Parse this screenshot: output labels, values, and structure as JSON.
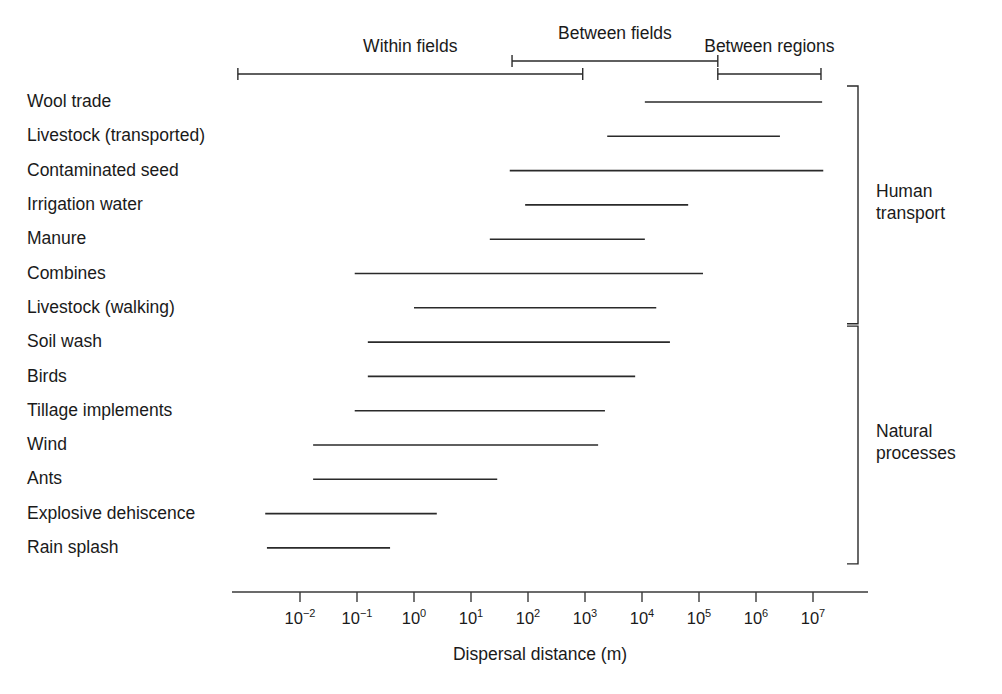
{
  "chart_data": {
    "type": "bar",
    "title": "",
    "xlabel": "Dispersal distance (m)",
    "ylabel": "",
    "scale": "log10",
    "xlim": [
      -2.9,
      7.3
    ],
    "grid": false,
    "tick_labels": [
      {
        "base": "10",
        "exp": "−2",
        "log": -2
      },
      {
        "base": "10",
        "exp": "−1",
        "log": -1
      },
      {
        "base": "10",
        "exp": "0",
        "log": 0
      },
      {
        "base": "10",
        "exp": "1",
        "log": 1
      },
      {
        "base": "10",
        "exp": "2",
        "log": 2
      },
      {
        "base": "10",
        "exp": "3",
        "log": 3
      },
      {
        "base": "10",
        "exp": "4",
        "log": 4
      },
      {
        "base": "10",
        "exp": "5",
        "log": 5
      },
      {
        "base": "10",
        "exp": "6",
        "log": 6
      },
      {
        "base": "10",
        "exp": "7",
        "log": 7
      }
    ],
    "categories": [
      "Wool trade",
      "Livestock (transported)",
      "Contaminated seed",
      "Irrigation water",
      "Manure",
      "Combines",
      "Livestock (walking)",
      "Soil wash",
      "Birds",
      "Tillage implements",
      "Wind",
      "Ants",
      "Explosive dehiscence",
      "Rain splash"
    ],
    "ranges_log10": [
      {
        "label": "Wool trade",
        "min": 4.05,
        "max": 7.16,
        "group": "Human transport"
      },
      {
        "label": "Livestock (transported)",
        "min": 3.39,
        "max": 6.42,
        "group": "Human transport"
      },
      {
        "label": "Contaminated seed",
        "min": 1.68,
        "max": 7.18,
        "group": "Human transport"
      },
      {
        "label": "Irrigation water",
        "min": 1.95,
        "max": 4.81,
        "group": "Human transport"
      },
      {
        "label": "Manure",
        "min": 1.33,
        "max": 4.05,
        "group": "Human transport"
      },
      {
        "label": "Combines",
        "min": -1.04,
        "max": 5.07,
        "group": "Human transport"
      },
      {
        "label": "Livestock (walking)",
        "min": 0.0,
        "max": 4.25,
        "group": "Human transport"
      },
      {
        "label": "Soil wash",
        "min": -0.81,
        "max": 4.49,
        "group": "Natural processes"
      },
      {
        "label": "Birds",
        "min": -0.81,
        "max": 3.88,
        "group": "Natural processes"
      },
      {
        "label": "Tillage implements",
        "min": -1.04,
        "max": 3.35,
        "group": "Natural processes"
      },
      {
        "label": "Wind",
        "min": -1.77,
        "max": 3.23,
        "group": "Natural processes"
      },
      {
        "label": "Ants",
        "min": -1.77,
        "max": 1.46,
        "group": "Natural processes"
      },
      {
        "label": "Explosive dehiscence",
        "min": -2.61,
        "max": 0.4,
        "group": "Natural processes"
      },
      {
        "label": "Rain splash",
        "min": -2.58,
        "max": -0.42,
        "group": "Natural processes"
      }
    ],
    "scale_bars": [
      {
        "label": "Within fields",
        "min": -3.09,
        "max": 2.96,
        "level": "lower"
      },
      {
        "label": "Between fields",
        "min": 1.72,
        "max": 5.33,
        "level": "upper"
      },
      {
        "label": "Between regions",
        "min": 5.33,
        "max": 7.14,
        "level": "lower"
      }
    ],
    "group_brackets": [
      {
        "label_line1": "Human",
        "label_line2": "transport",
        "rows": [
          0,
          6
        ]
      },
      {
        "label_line1": "Natural",
        "label_line2": "processes",
        "rows": [
          7,
          13
        ]
      }
    ]
  }
}
